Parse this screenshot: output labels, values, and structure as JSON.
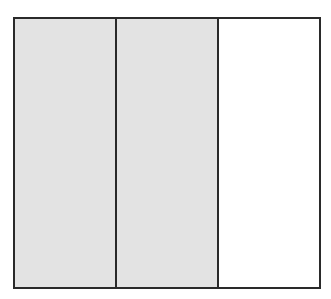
{
  "diagram": {
    "type": "fraction-bar",
    "total_parts": 3,
    "shaded_parts": 2,
    "parts": [
      {
        "index": 1,
        "shaded": true,
        "color": "#e3e3e3"
      },
      {
        "index": 2,
        "shaded": true,
        "color": "#e3e3e3"
      },
      {
        "index": 3,
        "shaded": false,
        "color": "#ffffff"
      }
    ],
    "border_color": "#2a2a2a"
  }
}
